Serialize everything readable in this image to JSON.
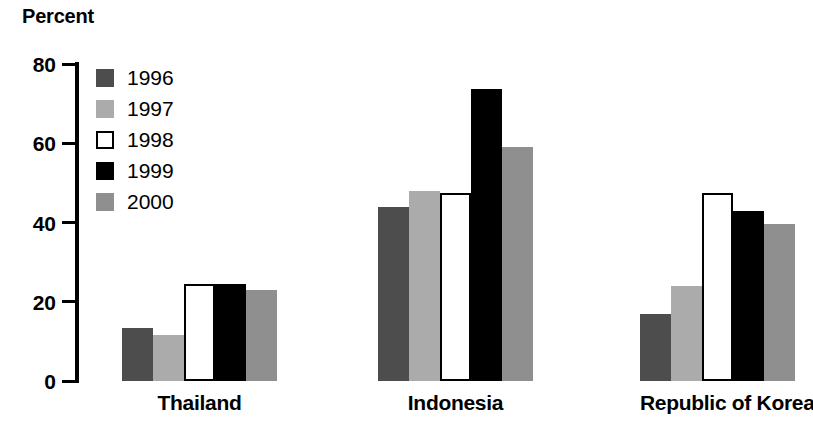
{
  "chart_data": {
    "type": "bar",
    "title": "Percent",
    "xlabel": "",
    "ylabel": "Percent",
    "ylim": [
      0,
      80
    ],
    "yticks": [
      0,
      20,
      40,
      60,
      80
    ],
    "ytick_labels": [
      "0",
      "20",
      "40",
      "60",
      "80"
    ],
    "grid": false,
    "legend_position": "upper-left-inside",
    "categories": [
      "Thailand",
      "Indonesia",
      "Republic of Korea"
    ],
    "series": [
      {
        "name": "1996",
        "color": "#4d4d4d",
        "values": [
          13.5,
          44.0,
          17.0
        ]
      },
      {
        "name": "1997",
        "color": "#ababab",
        "values": [
          11.5,
          48.0,
          24.0
        ]
      },
      {
        "name": "1998",
        "color": "#ffffff",
        "values": [
          24.5,
          47.5,
          47.5
        ]
      },
      {
        "name": "1999",
        "color": "#000000",
        "values": [
          24.5,
          73.7,
          43.0
        ]
      },
      {
        "name": "2000",
        "color": "#8f8f8f",
        "values": [
          23.0,
          59.0,
          39.5
        ]
      }
    ]
  },
  "legend": {
    "items": [
      {
        "label": "1996",
        "swatch": "legend-swatch-1996"
      },
      {
        "label": "1997",
        "swatch": "legend-swatch-1997"
      },
      {
        "label": "1998",
        "swatch": "legend-swatch-1998"
      },
      {
        "label": "1999",
        "swatch": "legend-swatch-1999"
      },
      {
        "label": "2000",
        "swatch": "legend-swatch-2000"
      }
    ]
  },
  "axis": {
    "tick_labels": [
      "80",
      "60",
      "40",
      "20",
      "0"
    ]
  },
  "colors": {
    "axis": "#000000",
    "background": "#ffffff",
    "bar_outline": "#000000"
  }
}
